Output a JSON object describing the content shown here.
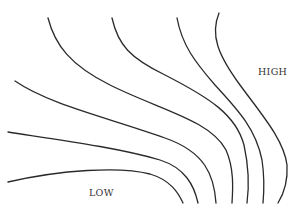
{
  "diagram": {
    "type": "contour-lines",
    "line_color": "#2a2a2a",
    "background": "#ffffff",
    "labels": {
      "high": "HIGH",
      "low": "LOW"
    },
    "contours": [
      {
        "id": "contour-1",
        "d": "M8,182 C60,170 120,166 150,174 C170,180 178,192 183,203"
      },
      {
        "id": "contour-2",
        "d": "M8,132 C60,140 120,148 160,160 C185,168 194,185 198,203"
      },
      {
        "id": "contour-3",
        "d": "M15,81 C50,105 110,118 165,138 C205,152 214,175 216,203"
      },
      {
        "id": "contour-4",
        "d": "M48,18 C55,45 70,65 110,85 C160,110 210,120 226,150 C234,168 233,188 232,203"
      },
      {
        "id": "contour-5",
        "d": "M112,18 C118,45 130,58 165,75 C210,98 236,115 244,145 C249,168 249,188 247,203"
      },
      {
        "id": "contour-6",
        "d": "M177,18 C182,45 195,62 215,85 C240,112 256,130 262,160 C265,180 264,192 263,203"
      },
      {
        "id": "contour-7",
        "d": "M219,13 C210,35 218,55 240,85 C262,115 284,140 287,165 C288,182 283,195 278,203"
      }
    ]
  }
}
